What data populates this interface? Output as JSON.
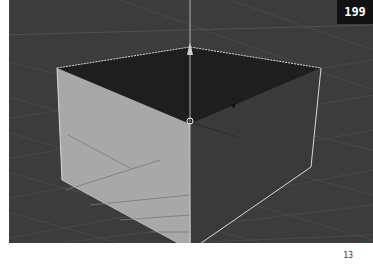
{
  "page_badge": "199",
  "page_number": "13",
  "viewport": {
    "background": "#3c3c3c",
    "grid_color": "#4a4a4a",
    "box": {
      "top_face_color": "#1e1e1e",
      "left_face_color": "#a8a8a8",
      "right_face_color": "#3a3a3a",
      "edge_color": "#d8d8d8"
    },
    "gizmo": {
      "axis_color": "#cfcfcf"
    }
  }
}
